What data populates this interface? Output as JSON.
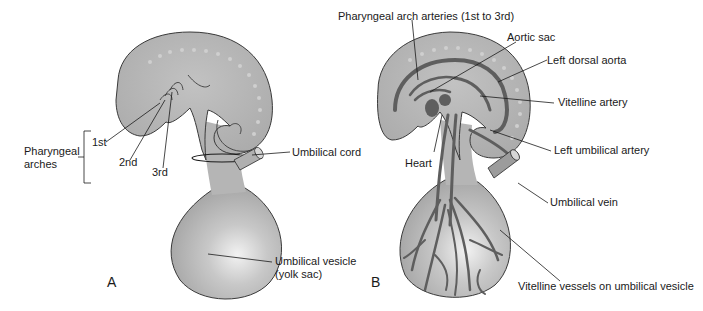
{
  "figure": {
    "panels": [
      {
        "id": "A",
        "label": "A",
        "labels": {
          "pharyngeal_arches": [
            "Pharyngeal",
            "arches"
          ],
          "first": "1st",
          "second": "2nd",
          "third": "3rd",
          "umbilical_cord": "Umbilical cord",
          "umbilical_vesicle": [
            "Umbilical vesicle",
            "(yolk sac)"
          ]
        }
      },
      {
        "id": "B",
        "label": "B",
        "labels": {
          "pharyngeal_arch_arteries": "Pharyngeal arch arteries (1st to 3rd)",
          "aortic_sac": "Aortic sac",
          "left_dorsal_aorta": "Left dorsal aorta",
          "vitelline_artery": "Vitelline artery",
          "left_umbilical_artery": "Left umbilical artery",
          "heart": "Heart",
          "umbilical_vein": "Umbilical vein",
          "vitelline_vessels": "Vitelline vessels on umbilical vesicle"
        }
      }
    ],
    "colors": {
      "embryo_fill": "#b4b4b4",
      "embryo_stroke": "#3a3a3a",
      "vessel": "#5e5e5e",
      "text": "#1a1a1a"
    }
  }
}
